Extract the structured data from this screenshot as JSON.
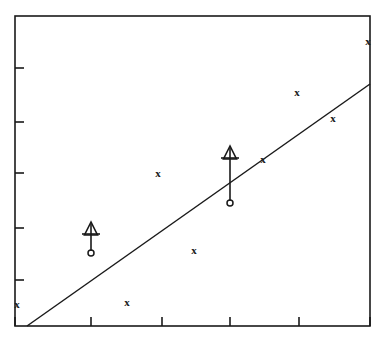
{
  "chart_data": {
    "type": "scatter",
    "title": "",
    "subtitle": "",
    "xlabel": "",
    "ylabel": "",
    "grid": false,
    "legend": null,
    "axis_frame": "full box",
    "xlim": [
      0,
      5
    ],
    "ylim": [
      0,
      6
    ],
    "x_ticks": [
      1,
      2,
      3,
      4
    ],
    "x_tick_labels": [
      "",
      "",
      "",
      ""
    ],
    "y_ticks": [
      1,
      2,
      3,
      4,
      5
    ],
    "y_tick_labels": [
      "",
      "",
      "",
      "",
      ""
    ],
    "series": [
      {
        "name": "detections",
        "marker": "x",
        "points": [
          {
            "x": 0.0,
            "y": 0.39,
            "px": 17,
            "py": 305
          },
          {
            "x": 1.56,
            "y": 0.42,
            "px": 127,
            "py": 303
          },
          {
            "x": 2.0,
            "y": 2.83,
            "px": 158,
            "py": 174
          },
          {
            "x": 2.52,
            "y": 1.4,
            "px": 194,
            "py": 251
          },
          {
            "x": 3.5,
            "y": 3.1,
            "px": 263,
            "py": 160
          },
          {
            "x": 4.0,
            "y": 4.35,
            "px": 297,
            "py": 93
          },
          {
            "x": 4.5,
            "y": 3.86,
            "px": 333,
            "py": 119
          },
          {
            "x": 5.0,
            "y": 5.3,
            "px": 368,
            "py": 42
          }
        ]
      },
      {
        "name": "upper-limits",
        "marker": "circle-with-up-arrow",
        "points": [
          {
            "x": 1.08,
            "y": 1.37,
            "px": 91,
            "py": 253,
            "arrow_tip_py": 222
          },
          {
            "x": 3.04,
            "y": 2.32,
            "px": 230,
            "py": 203,
            "arrow_tip_py": 146
          }
        ]
      }
    ],
    "fit_line": {
      "name": "linear fit",
      "start": {
        "px": 27,
        "py": 326
      },
      "end": {
        "px": 370,
        "py": 84
      }
    }
  },
  "figure": {
    "frame": {
      "left": 15,
      "right": 370,
      "top": 16,
      "bottom": 326
    },
    "stroke_color": "#1a1a1a",
    "background_color": "#ffffff"
  }
}
